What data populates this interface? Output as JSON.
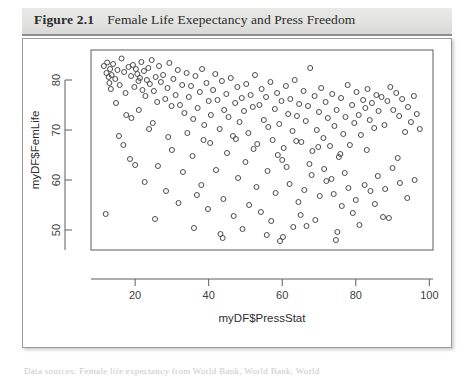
{
  "figure": {
    "label": "Figure 2.1",
    "caption": "Female Life Exepectancy and Press Freedom"
  },
  "source_note": "Data sources: Female life expectancy from World Bank, World Bank, World",
  "colors": {
    "title_band_bg": "#e4e4e2",
    "title_band_rule": "#8e8e8c",
    "panel_border": "#9a9a98",
    "axis": "#5d5d5d",
    "point_stroke": "#4a4a4a",
    "text": "#2e2e2e"
  },
  "chart_data": {
    "type": "scatter",
    "title": "Female Life Exepectancy and Press Freedom",
    "xlabel": "myDF$PressStat",
    "ylabel": "myDF$FemLife",
    "xlim": [
      8,
      101
    ],
    "ylim": [
      46,
      86
    ],
    "xticks": [
      20,
      40,
      60,
      80,
      100
    ],
    "yticks": [
      50,
      60,
      70,
      80
    ],
    "grid": false,
    "legend": null,
    "marker": "open-circle",
    "marker_size_px": 5,
    "points": [
      [
        11.5,
        82.8
      ],
      [
        12.2,
        81.4
      ],
      [
        12.4,
        83.5
      ],
      [
        12.8,
        80.6
      ],
      [
        13.0,
        79.4
      ],
      [
        13.2,
        82.2
      ],
      [
        13.4,
        78.2
      ],
      [
        13.6,
        81.0
      ],
      [
        14.0,
        83.2
      ],
      [
        14.6,
        80.2
      ],
      [
        15.2,
        82.0
      ],
      [
        15.8,
        79.0
      ],
      [
        16.3,
        84.3
      ],
      [
        17.0,
        81.6
      ],
      [
        17.4,
        77.4
      ],
      [
        18.2,
        82.6
      ],
      [
        18.9,
        80.8
      ],
      [
        19.4,
        83.0
      ],
      [
        19.8,
        78.6
      ],
      [
        20.2,
        82.2
      ],
      [
        20.6,
        81.2
      ],
      [
        20.9,
        79.8
      ],
      [
        21.3,
        80.4
      ],
      [
        21.7,
        83.6
      ],
      [
        22.0,
        78.0
      ],
      [
        22.4,
        81.8
      ],
      [
        22.8,
        76.8
      ],
      [
        23.2,
        80.0
      ],
      [
        23.6,
        82.4
      ],
      [
        24.0,
        79.2
      ],
      [
        24.5,
        84.0
      ],
      [
        25.1,
        77.8
      ],
      [
        25.6,
        80.6
      ],
      [
        26.0,
        75.6
      ],
      [
        26.5,
        82.8
      ],
      [
        27.0,
        79.6
      ],
      [
        27.6,
        81.0
      ],
      [
        28.2,
        76.2
      ],
      [
        28.8,
        78.4
      ],
      [
        29.3,
        83.4
      ],
      [
        29.9,
        74.8
      ],
      [
        30.4,
        80.2
      ],
      [
        31.0,
        77.0
      ],
      [
        31.6,
        82.0
      ],
      [
        32.2,
        75.0
      ],
      [
        32.8,
        79.0
      ],
      [
        33.4,
        73.4
      ],
      [
        34.0,
        81.4
      ],
      [
        34.6,
        76.6
      ],
      [
        35.2,
        78.8
      ],
      [
        35.8,
        72.2
      ],
      [
        36.4,
        80.8
      ],
      [
        37.0,
        74.4
      ],
      [
        37.6,
        77.6
      ],
      [
        38.2,
        82.2
      ],
      [
        38.8,
        71.0
      ],
      [
        39.4,
        79.4
      ],
      [
        40.0,
        75.8
      ],
      [
        40.6,
        73.0
      ],
      [
        41.2,
        78.0
      ],
      [
        41.8,
        81.2
      ],
      [
        42.4,
        76.0
      ],
      [
        43.0,
        70.2
      ],
      [
        43.6,
        79.8
      ],
      [
        44.2,
        74.0
      ],
      [
        44.8,
        77.2
      ],
      [
        45.4,
        72.6
      ],
      [
        46.0,
        80.4
      ],
      [
        46.6,
        68.8
      ],
      [
        47.2,
        75.4
      ],
      [
        47.8,
        78.6
      ],
      [
        48.4,
        71.6
      ],
      [
        49.0,
        76.4
      ],
      [
        49.6,
        73.8
      ],
      [
        50.2,
        79.2
      ],
      [
        50.8,
        69.4
      ],
      [
        51.4,
        77.0
      ],
      [
        52.0,
        74.6
      ],
      [
        52.6,
        81.0
      ],
      [
        53.2,
        67.2
      ],
      [
        53.8,
        75.0
      ],
      [
        54.4,
        78.2
      ],
      [
        55.0,
        72.0
      ],
      [
        55.6,
        76.6
      ],
      [
        56.2,
        70.6
      ],
      [
        56.8,
        79.6
      ],
      [
        57.4,
        68.0
      ],
      [
        58.0,
        74.2
      ],
      [
        58.6,
        77.4
      ],
      [
        59.2,
        71.2
      ],
      [
        59.8,
        75.8
      ],
      [
        60.4,
        66.4
      ],
      [
        61.0,
        78.8
      ],
      [
        61.6,
        73.2
      ],
      [
        62.2,
        76.2
      ],
      [
        62.8,
        69.8
      ],
      [
        63.4,
        80.0
      ],
      [
        64.0,
        72.8
      ],
      [
        64.6,
        75.2
      ],
      [
        65.2,
        67.6
      ],
      [
        65.8,
        77.8
      ],
      [
        66.4,
        71.8
      ],
      [
        67.0,
        74.8
      ],
      [
        67.6,
        82.4
      ],
      [
        68.2,
        65.8
      ],
      [
        68.8,
        76.8
      ],
      [
        69.4,
        70.0
      ],
      [
        70.0,
        73.6
      ],
      [
        70.6,
        78.4
      ],
      [
        71.2,
        68.4
      ],
      [
        71.8,
        75.6
      ],
      [
        72.4,
        72.4
      ],
      [
        73.0,
        66.8
      ],
      [
        73.6,
        77.2
      ],
      [
        74.2,
        70.8
      ],
      [
        74.8,
        74.0
      ],
      [
        75.4,
        64.6
      ],
      [
        76.0,
        76.4
      ],
      [
        76.6,
        69.2
      ],
      [
        77.2,
        72.6
      ],
      [
        77.8,
        79.0
      ],
      [
        78.4,
        67.0
      ],
      [
        79.0,
        75.0
      ],
      [
        79.6,
        71.4
      ],
      [
        80.2,
        77.6
      ],
      [
        80.8,
        73.0
      ],
      [
        81.4,
        69.0
      ],
      [
        82.0,
        76.0
      ],
      [
        82.6,
        74.4
      ],
      [
        83.2,
        78.2
      ],
      [
        83.8,
        72.0
      ],
      [
        84.4,
        75.4
      ],
      [
        85.0,
        70.4
      ],
      [
        85.6,
        77.0
      ],
      [
        86.2,
        73.8
      ],
      [
        87.0,
        76.6
      ],
      [
        87.8,
        71.0
      ],
      [
        88.6,
        75.8
      ],
      [
        89.4,
        78.6
      ],
      [
        90.2,
        74.0
      ],
      [
        91.0,
        77.4
      ],
      [
        91.8,
        72.8
      ],
      [
        92.6,
        76.2
      ],
      [
        93.4,
        69.6
      ],
      [
        94.2,
        74.6
      ],
      [
        95.0,
        71.6
      ],
      [
        95.8,
        76.8
      ],
      [
        96.6,
        73.2
      ],
      [
        97.4,
        70.2
      ],
      [
        12.0,
        53.2
      ],
      [
        25.4,
        52.2
      ],
      [
        20.0,
        63.0
      ],
      [
        22.6,
        59.6
      ],
      [
        18.6,
        64.2
      ],
      [
        16.8,
        67.0
      ],
      [
        30.0,
        66.0
      ],
      [
        26.2,
        62.8
      ],
      [
        33.0,
        61.6
      ],
      [
        28.4,
        57.8
      ],
      [
        35.6,
        64.8
      ],
      [
        38.0,
        59.0
      ],
      [
        31.8,
        55.4
      ],
      [
        42.0,
        62.0
      ],
      [
        36.8,
        57.0
      ],
      [
        45.0,
        65.4
      ],
      [
        39.8,
        54.2
      ],
      [
        48.0,
        60.4
      ],
      [
        44.0,
        56.2
      ],
      [
        50.0,
        63.6
      ],
      [
        46.8,
        52.8
      ],
      [
        53.0,
        58.6
      ],
      [
        51.0,
        55.0
      ],
      [
        56.0,
        61.8
      ],
      [
        54.2,
        53.6
      ],
      [
        58.2,
        57.4
      ],
      [
        60.0,
        64.0
      ],
      [
        62.0,
        59.2
      ],
      [
        57.0,
        51.8
      ],
      [
        64.4,
        55.6
      ],
      [
        61.2,
        62.6
      ],
      [
        66.0,
        58.0
      ],
      [
        63.0,
        50.6
      ],
      [
        68.0,
        61.0
      ],
      [
        65.0,
        53.0
      ],
      [
        70.2,
        56.8
      ],
      [
        67.4,
        63.2
      ],
      [
        72.0,
        59.8
      ],
      [
        69.0,
        52.0
      ],
      [
        74.0,
        57.2
      ],
      [
        71.4,
        62.2
      ],
      [
        76.2,
        54.8
      ],
      [
        73.4,
        60.2
      ],
      [
        78.0,
        58.4
      ],
      [
        75.0,
        49.6
      ],
      [
        80.0,
        56.0
      ],
      [
        77.0,
        61.4
      ],
      [
        82.4,
        59.0
      ],
      [
        79.2,
        53.4
      ],
      [
        84.0,
        57.8
      ],
      [
        86.0,
        60.8
      ],
      [
        81.0,
        51.0
      ],
      [
        88.0,
        58.2
      ],
      [
        90.0,
        62.4
      ],
      [
        85.2,
        55.2
      ],
      [
        92.0,
        59.4
      ],
      [
        94.0,
        56.4
      ],
      [
        89.0,
        52.4
      ],
      [
        96.0,
        60.0
      ],
      [
        43.2,
        49.2
      ],
      [
        43.8,
        48.4
      ],
      [
        59.4,
        47.8
      ],
      [
        60.2,
        48.6
      ],
      [
        74.6,
        48.0
      ],
      [
        49.2,
        50.2
      ],
      [
        55.8,
        49.0
      ],
      [
        66.6,
        50.8
      ],
      [
        87.4,
        52.6
      ],
      [
        36.0,
        50.4
      ],
      [
        40.4,
        67.4
      ],
      [
        47.4,
        68.2
      ],
      [
        52.2,
        66.2
      ],
      [
        58.8,
        65.0
      ],
      [
        63.8,
        67.8
      ],
      [
        69.8,
        66.6
      ],
      [
        75.8,
        65.2
      ],
      [
        83.0,
        66.0
      ],
      [
        91.4,
        64.4
      ],
      [
        29.0,
        68.6
      ],
      [
        23.8,
        70.2
      ],
      [
        17.6,
        73.0
      ],
      [
        14.8,
        75.4
      ],
      [
        34.2,
        69.4
      ],
      [
        38.6,
        68.0
      ],
      [
        15.6,
        68.8
      ],
      [
        19.0,
        72.4
      ],
      [
        21.0,
        74.0
      ],
      [
        24.8,
        71.4
      ]
    ]
  }
}
